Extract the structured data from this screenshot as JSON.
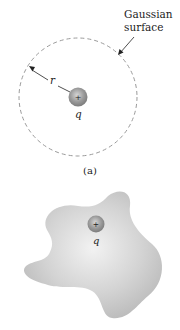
{
  "figure_a": {
    "surface_label_line1": "Gaussian",
    "surface_label_line2": "surface",
    "radius_label": "r",
    "charge_label": "q",
    "charge_sign": "+",
    "caption": "(a)"
  },
  "figure_b": {
    "charge_label": "q",
    "charge_sign": "+"
  },
  "colors": {
    "dashed_circle": "#9a9a9a",
    "charge_fill": "#9e9e9e",
    "blob_fill": "#cfcfcf",
    "text": "#222222"
  }
}
